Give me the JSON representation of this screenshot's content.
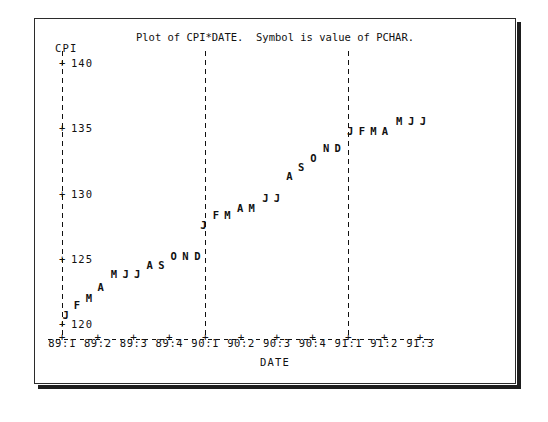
{
  "chart_data": {
    "type": "scatter",
    "title": "Plot of CPI*DATE.  Symbol is value of PCHAR.",
    "xlabel": "DATE",
    "ylabel": "CPI",
    "ylim": [
      118.5,
      141.5
    ],
    "yticks": [
      120,
      125,
      130,
      135,
      140
    ],
    "ytick_labels": [
      "120",
      "125",
      "130",
      "135",
      "140"
    ],
    "xticks": [
      "89:1",
      "89:2",
      "89:3",
      "89:4",
      "90:1",
      "90:2",
      "90:3",
      "90:4",
      "91:1",
      "91:2",
      "91:3"
    ],
    "grid": false,
    "legend": "none",
    "reference_lines": [
      "90:1",
      "91:1"
    ],
    "point_symbol_note": "Symbol is value of PCHAR (month initial)",
    "points": [
      {
        "label": "J",
        "x": 0.1,
        "y": 120.8
      },
      {
        "label": "F",
        "x": 0.42,
        "y": 121.5
      },
      {
        "label": "M",
        "x": 0.75,
        "y": 122.1
      },
      {
        "label": "A",
        "x": 1.08,
        "y": 122.9
      },
      {
        "label": "M",
        "x": 1.45,
        "y": 123.9
      },
      {
        "label": "J",
        "x": 1.78,
        "y": 123.9
      },
      {
        "label": "J",
        "x": 2.1,
        "y": 123.9
      },
      {
        "label": "A",
        "x": 2.45,
        "y": 124.6
      },
      {
        "label": "S",
        "x": 2.78,
        "y": 124.6
      },
      {
        "label": "O",
        "x": 3.12,
        "y": 125.3
      },
      {
        "label": "N",
        "x": 3.45,
        "y": 125.3
      },
      {
        "label": "D",
        "x": 3.78,
        "y": 125.3
      },
      {
        "label": "J",
        "x": 3.95,
        "y": 127.7
      },
      {
        "label": "F",
        "x": 4.3,
        "y": 128.4
      },
      {
        "label": "M",
        "x": 4.62,
        "y": 128.4
      },
      {
        "label": "A",
        "x": 4.98,
        "y": 129.0
      },
      {
        "label": "M",
        "x": 5.3,
        "y": 129.0
      },
      {
        "label": "J",
        "x": 5.68,
        "y": 129.7
      },
      {
        "label": "J",
        "x": 6.0,
        "y": 129.7
      },
      {
        "label": "A",
        "x": 6.35,
        "y": 131.4
      },
      {
        "label": "S",
        "x": 6.68,
        "y": 132.1
      },
      {
        "label": "O",
        "x": 7.02,
        "y": 132.8
      },
      {
        "label": "N",
        "x": 7.38,
        "y": 133.6
      },
      {
        "label": "D",
        "x": 7.7,
        "y": 133.6
      },
      {
        "label": "J",
        "x": 8.05,
        "y": 134.9
      },
      {
        "label": "F",
        "x": 8.38,
        "y": 134.9
      },
      {
        "label": "M",
        "x": 8.7,
        "y": 134.9
      },
      {
        "label": "A",
        "x": 9.02,
        "y": 134.9
      },
      {
        "label": "M",
        "x": 9.42,
        "y": 135.6
      },
      {
        "label": "J",
        "x": 9.75,
        "y": 135.6
      },
      {
        "label": "J",
        "x": 10.08,
        "y": 135.6
      }
    ]
  }
}
